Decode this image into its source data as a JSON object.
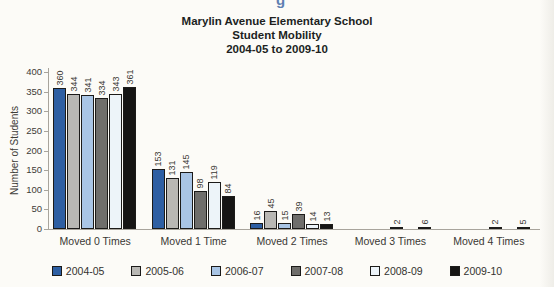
{
  "page": {
    "top_artifact_fragment": "g"
  },
  "chart_data": {
    "type": "bar",
    "title_lines": [
      "Marylin Avenue Elementary School",
      "Student Mobility",
      "2004-05 to 2009-10"
    ],
    "ylabel": "Number of Students",
    "xlabel": "",
    "categories": [
      "Moved 0 Times",
      "Moved 1 Time",
      "Moved 2 Times",
      "Moved 3 Times",
      "Moved 4 Times"
    ],
    "series": [
      {
        "name": "2004-05",
        "color": "#2e5fa3",
        "values": [
          360,
          153,
          16,
          0,
          0
        ]
      },
      {
        "name": "2005-06",
        "color": "#b9b8b4",
        "values": [
          344,
          131,
          45,
          0,
          0
        ]
      },
      {
        "name": "2006-07",
        "color": "#a9c5e5",
        "values": [
          341,
          145,
          15,
          0,
          0
        ]
      },
      {
        "name": "2007-08",
        "color": "#6f6e6b",
        "values": [
          334,
          98,
          39,
          2,
          2
        ]
      },
      {
        "name": "2008-09",
        "color": "#edf4f9",
        "values": [
          343,
          119,
          14,
          0,
          0
        ]
      },
      {
        "name": "2009-10",
        "color": "#161514",
        "values": [
          361,
          84,
          13,
          6,
          5
        ]
      }
    ],
    "ylim": [
      0,
      400
    ],
    "ytick_step": 50,
    "yticks": [
      0,
      50,
      100,
      150,
      200,
      250,
      300,
      350,
      400
    ],
    "grid": false,
    "bar_labels_shown": true,
    "bar_label_rotation": "vertical",
    "legend_position": "bottom"
  }
}
